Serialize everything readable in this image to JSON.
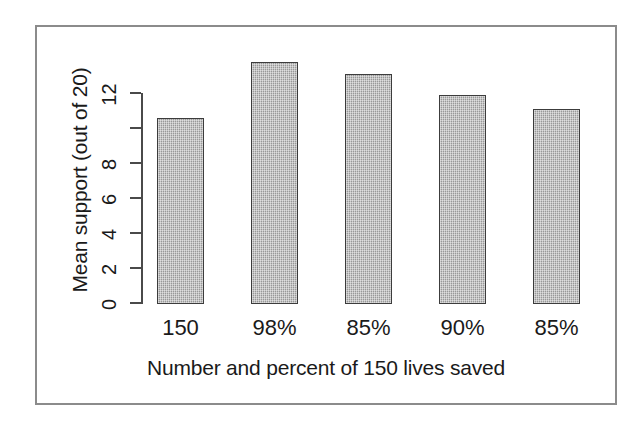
{
  "chart_data": {
    "type": "bar",
    "title": "",
    "subtitle": "",
    "categories": [
      "150",
      "98%",
      "85%",
      "90%",
      "85%"
    ],
    "values": [
      10.6,
      13.8,
      13.1,
      11.9,
      11.1
    ],
    "xlabel": "Number and percent of 150 lives saved",
    "ylabel": "Mean support (out of 20)",
    "ylim": [
      0,
      12
    ],
    "yticks": [
      0,
      2,
      4,
      6,
      8,
      10,
      12
    ],
    "ytick_labels": [
      "0",
      "2",
      "4",
      "6",
      "8",
      "",
      "12"
    ],
    "grid": false,
    "legend": null,
    "bar_fill_color": "#a9a9a9",
    "bar_border_color": "#3c3c3c",
    "axis_color": "#4a4a4a",
    "text_color": "#1a1a1a",
    "frame_color": "#8b8b8b",
    "background_color": "#ffffff"
  }
}
